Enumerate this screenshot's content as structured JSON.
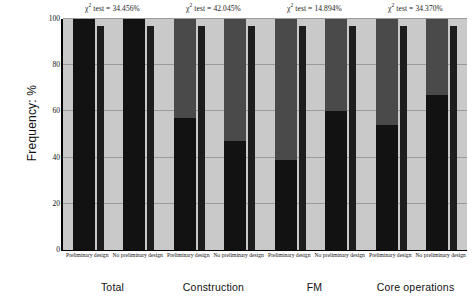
{
  "chart_data": {
    "type": "bar",
    "title": "",
    "subtitle": "",
    "xlabel": "",
    "ylabel": "Frequency: %",
    "ylim": [
      0,
      100
    ],
    "yticks": [
      0,
      20,
      40,
      60,
      80,
      100
    ],
    "grid": true,
    "legend_position": "none",
    "stacked": true,
    "groups": [
      {
        "name": "Total",
        "annotation": "χ² test = 34.456%",
        "annotation_prefix": "χ",
        "annotation_sup": "2",
        "annotation_rest": " test = 34.456%",
        "categories": [
          {
            "label": "Preliminary design",
            "bars": [
              {
                "name": "wide",
                "total": 100.0,
                "lower_segment": 100.0,
                "upper_segment": 0.0
              },
              {
                "name": "narrow",
                "total": 97.0,
                "lower_segment": 97.0,
                "upper_segment": 0.0
              }
            ]
          },
          {
            "label": "No preliminary design",
            "bars": [
              {
                "name": "wide",
                "total": 100.0,
                "lower_segment": 100.0,
                "upper_segment": 0.0
              },
              {
                "name": "narrow",
                "total": 97.0,
                "lower_segment": 97.0,
                "upper_segment": 0.0
              }
            ]
          }
        ]
      },
      {
        "name": "Construction",
        "annotation": "χ² test = 42.045%",
        "annotation_prefix": "χ",
        "annotation_sup": "2",
        "annotation_rest": " test = 42.045%",
        "categories": [
          {
            "label": "Preliminary design",
            "bars": [
              {
                "name": "wide",
                "total": 100.0,
                "lower_segment": 57.0,
                "upper_segment": 43.0
              },
              {
                "name": "narrow",
                "total": 97.0,
                "lower_segment": 97.0,
                "upper_segment": 0.0
              }
            ]
          },
          {
            "label": "No preliminary design",
            "bars": [
              {
                "name": "wide",
                "total": 100.0,
                "lower_segment": 47.0,
                "upper_segment": 53.0
              },
              {
                "name": "narrow",
                "total": 97.0,
                "lower_segment": 97.0,
                "upper_segment": 0.0
              }
            ]
          }
        ]
      },
      {
        "name": "FM",
        "annotation": "χ² test = 14.894%",
        "annotation_prefix": "χ",
        "annotation_sup": "2",
        "annotation_rest": " test = 14.894%",
        "categories": [
          {
            "label": "Preliminary design",
            "bars": [
              {
                "name": "wide",
                "total": 100.0,
                "lower_segment": 39.0,
                "upper_segment": 61.0
              },
              {
                "name": "narrow",
                "total": 97.0,
                "lower_segment": 97.0,
                "upper_segment": 0.0
              }
            ]
          },
          {
            "label": "No preliminary design",
            "bars": [
              {
                "name": "wide",
                "total": 100.0,
                "lower_segment": 60.0,
                "upper_segment": 40.0
              },
              {
                "name": "narrow",
                "total": 97.0,
                "lower_segment": 97.0,
                "upper_segment": 0.0
              }
            ]
          }
        ]
      },
      {
        "name": "Core operations",
        "annotation": "χ² test = 34.370%",
        "annotation_prefix": "χ",
        "annotation_sup": "2",
        "annotation_rest": " test = 34.370%",
        "categories": [
          {
            "label": "Preliminary design",
            "bars": [
              {
                "name": "wide",
                "total": 100.0,
                "lower_segment": 54.0,
                "upper_segment": 46.0
              },
              {
                "name": "narrow",
                "total": 97.0,
                "lower_segment": 97.0,
                "upper_segment": 0.0
              }
            ]
          },
          {
            "label": "No preliminary design",
            "bars": [
              {
                "name": "wide",
                "total": 100.0,
                "lower_segment": 67.0,
                "upper_segment": 33.0
              },
              {
                "name": "narrow",
                "total": 97.0,
                "lower_segment": 97.0,
                "upper_segment": 0.0
              }
            ]
          }
        ]
      }
    ],
    "colors": {
      "plot_background": "#c9c9c9",
      "gridline": "#9a9a9a",
      "segment_upper": "#4a4a4a",
      "segment_lower": "#121212",
      "axis": "#000000",
      "text": "#111111"
    }
  }
}
